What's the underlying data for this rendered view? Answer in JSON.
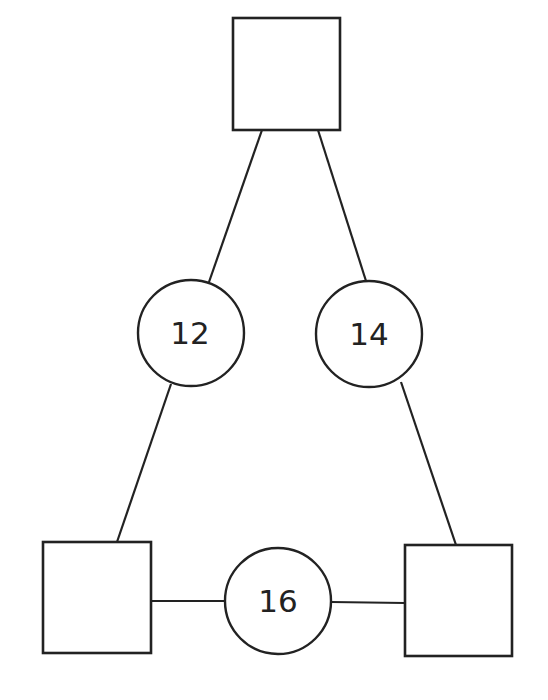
{
  "diagram": {
    "type": "number-triangle",
    "squares": [
      {
        "id": "top",
        "value": ""
      },
      {
        "id": "bottom-left",
        "value": ""
      },
      {
        "id": "bottom-right",
        "value": ""
      }
    ],
    "circles": [
      {
        "id": "left",
        "value": "12",
        "connects": [
          "top",
          "bottom-left"
        ]
      },
      {
        "id": "right",
        "value": "14",
        "connects": [
          "top",
          "bottom-right"
        ]
      },
      {
        "id": "bottom",
        "value": "16",
        "connects": [
          "bottom-left",
          "bottom-right"
        ]
      }
    ],
    "colors": {
      "stroke": "#222222",
      "fill": "#ffffff"
    }
  }
}
